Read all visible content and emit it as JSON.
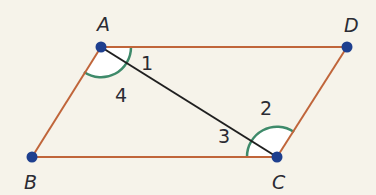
{
  "diagram": {
    "colors": {
      "side": "#c0653a",
      "diagonal": "#1f1f1f",
      "vertex": "#1e3f8f",
      "arc": "#3e8a6a",
      "arc_fill": "#ffffff",
      "background": "#f6f3ea"
    },
    "vertices": [
      {
        "name": "A",
        "label": "A"
      },
      {
        "name": "B",
        "label": "B"
      },
      {
        "name": "C",
        "label": "C"
      },
      {
        "name": "D",
        "label": "D"
      }
    ],
    "sides": [
      "AD",
      "DC",
      "CB",
      "BA"
    ],
    "diagonals": [
      "AC"
    ],
    "angle_labels": [
      "1",
      "2",
      "3",
      "4"
    ],
    "marked_angles": [
      {
        "at": "A",
        "between": "AB and AD",
        "contains_labels": [
          "1",
          "4"
        ]
      },
      {
        "at": "C",
        "between": "CB and CD",
        "contains_labels": [
          "2",
          "3"
        ]
      }
    ]
  }
}
